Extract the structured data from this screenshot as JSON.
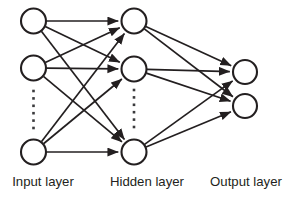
{
  "figure": {
    "background_color": "#ffffff",
    "stroke_color": "#231f20",
    "node_fill_color": "#ffffff",
    "dot_color": "#3a3a3c",
    "width": 291,
    "height": 198
  },
  "labels": {
    "input": "Input layer",
    "hidden": "Hidden layer",
    "output": "Output layer"
  },
  "chart_data": {
    "type": "diagram",
    "diagram_kind": "neural-network",
    "layers": [
      {
        "id": "input",
        "label": "Input layer",
        "label_x": 43,
        "label_y": 186,
        "x": 33.5,
        "node_radius": 12.5,
        "nodes": [
          {
            "id": "i1",
            "cx": 33.5,
            "cy": 21
          },
          {
            "id": "i2",
            "cx": 33.5,
            "cy": 68
          },
          {
            "id": "i3",
            "cx": 33.5,
            "cy": 152
          }
        ],
        "ellipsis": {
          "x": 33.5,
          "y_start": 91,
          "y_end": 128,
          "count": 6,
          "dot_size": 2.6
        }
      },
      {
        "id": "hidden",
        "label": "Hidden layer",
        "label_x": 147,
        "label_y": 186,
        "x": 134,
        "node_radius": 12.5,
        "nodes": [
          {
            "id": "h1",
            "cx": 134,
            "cy": 21
          },
          {
            "id": "h2",
            "cx": 134,
            "cy": 69
          },
          {
            "id": "h3",
            "cx": 134,
            "cy": 152
          }
        ],
        "ellipsis": {
          "x": 134,
          "y_start": 90,
          "y_end": 127,
          "count": 6,
          "dot_size": 2.6
        }
      },
      {
        "id": "output",
        "label": "Output layer",
        "label_x": 246,
        "label_y": 186,
        "x": 245,
        "node_radius": 12,
        "nodes": [
          {
            "id": "o1",
            "cx": 245,
            "cy": 72
          },
          {
            "id": "o2",
            "cx": 245,
            "cy": 106
          }
        ],
        "ellipsis": null
      }
    ],
    "edges": [
      {
        "from": "i1",
        "to": "h1"
      },
      {
        "from": "i1",
        "to": "h2"
      },
      {
        "from": "i1",
        "to": "h3"
      },
      {
        "from": "i2",
        "to": "h1"
      },
      {
        "from": "i2",
        "to": "h2"
      },
      {
        "from": "i2",
        "to": "h3"
      },
      {
        "from": "i3",
        "to": "h1"
      },
      {
        "from": "i3",
        "to": "h2"
      },
      {
        "from": "i3",
        "to": "h3"
      },
      {
        "from": "h1",
        "to": "o1"
      },
      {
        "from": "h1",
        "to": "o2"
      },
      {
        "from": "h2",
        "to": "o1"
      },
      {
        "from": "h2",
        "to": "o2"
      },
      {
        "from": "h3",
        "to": "o1"
      },
      {
        "from": "h3",
        "to": "o2"
      }
    ],
    "edge_style": {
      "directed": true,
      "arrowhead": "filled-triangle",
      "stroke_width": 1.7
    },
    "node_count": {
      "input": 3,
      "hidden": 3,
      "output": 2
    },
    "connectivity": "fully-connected"
  }
}
